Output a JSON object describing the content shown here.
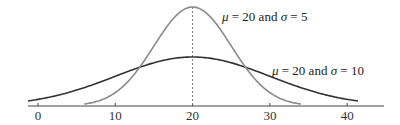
{
  "chart_data": {
    "type": "line",
    "title": "",
    "xlabel": "",
    "ylabel": "",
    "xlim": [
      -1.3,
      44.6
    ],
    "x_ticks": [
      0,
      10,
      20,
      30,
      40
    ],
    "x_tick_labels": [
      "0",
      "10",
      "20",
      "30",
      "40"
    ],
    "grid": false,
    "y_axis_visible": false,
    "series": [
      {
        "name": "μ = 20 and σ = 5",
        "distribution": "normal",
        "mu": 20,
        "sigma": 5,
        "x_range": [
          6,
          34
        ],
        "color": "#8a8a8a",
        "peak_height_px": 99
      },
      {
        "name": "μ = 20 and σ = 10",
        "distribution": "normal",
        "mu": 20,
        "sigma": 10,
        "x_range": [
          -1.3,
          41.4
        ],
        "color": "#333333",
        "peak_height_px": 49
      }
    ],
    "annotations": [
      {
        "type": "dashed_vertical_line",
        "x": 20,
        "color": "#777777"
      },
      {
        "text": "μ = 20 and σ = 5",
        "near": "narrow curve, right of peak"
      },
      {
        "text": "μ = 20 and σ = 10",
        "near": "wide curve, right side"
      }
    ]
  },
  "labels": {
    "narrow": {
      "mu_symbol": "μ",
      "text_mid": " = 20 and ",
      "sigma_symbol": "σ",
      "text_end": " = 5"
    },
    "wide": {
      "mu_symbol": "μ",
      "text_mid": " = 20 and ",
      "sigma_symbol": "σ",
      "text_end": " = 10"
    }
  }
}
